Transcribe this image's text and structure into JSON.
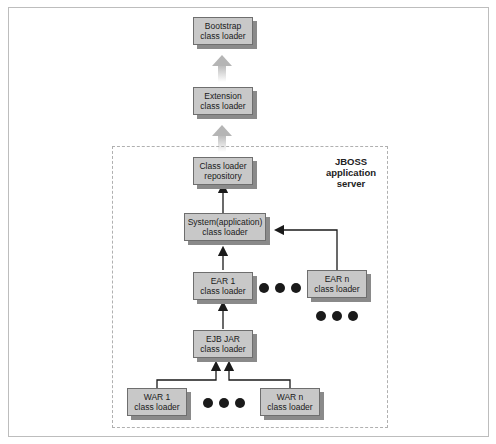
{
  "diagram": {
    "container_label": [
      "JBOSS application",
      "server"
    ],
    "nodes": [
      {
        "id": "bootstrap",
        "lines": [
          "Bootstrap",
          "class loader"
        ]
      },
      {
        "id": "extension",
        "lines": [
          "Extension",
          "class loader"
        ]
      },
      {
        "id": "repository",
        "lines": [
          "Class loader",
          "repository"
        ]
      },
      {
        "id": "system",
        "lines": [
          "System(application)",
          "class loader"
        ]
      },
      {
        "id": "ear1",
        "lines": [
          "EAR 1",
          "class loader"
        ]
      },
      {
        "id": "earn",
        "lines": [
          "EAR n",
          "class loader"
        ]
      },
      {
        "id": "ejbjar",
        "lines": [
          "EJB JAR",
          "class loader"
        ]
      },
      {
        "id": "war1",
        "lines": [
          "WAR 1",
          "class loader"
        ]
      },
      {
        "id": "warn",
        "lines": [
          "WAR n",
          "class loader"
        ]
      }
    ],
    "edges": [
      {
        "from": "extension",
        "to": "bootstrap",
        "style": "thick-gray"
      },
      {
        "from": "repository",
        "to": "extension",
        "style": "thick-gray"
      },
      {
        "from": "system",
        "to": "repository",
        "style": "arrow"
      },
      {
        "from": "ear1",
        "to": "system",
        "style": "arrow"
      },
      {
        "from": "earn",
        "to": "system",
        "style": "arrow"
      },
      {
        "from": "ejbjar",
        "to": "ear1",
        "style": "arrow"
      },
      {
        "from": "war1",
        "to": "ejbjar",
        "style": "arrow"
      },
      {
        "from": "warn",
        "to": "ejbjar",
        "style": "arrow"
      }
    ],
    "ellipses": [
      "between EAR 1 and EAR n",
      "below EAR n",
      "between WAR 1 and WAR n"
    ]
  }
}
